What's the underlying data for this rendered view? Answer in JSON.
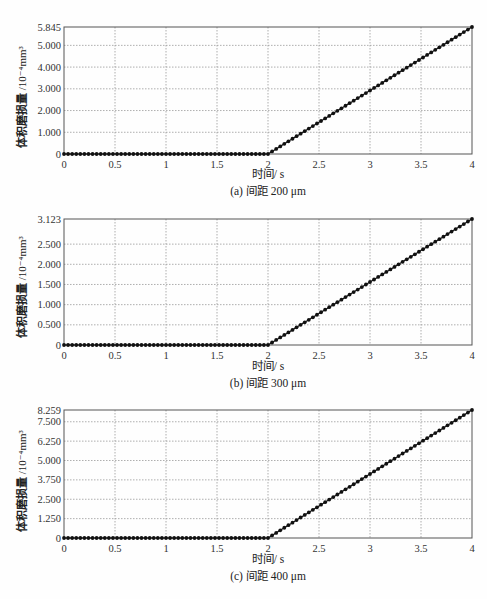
{
  "chart_data": [
    {
      "type": "line",
      "title": "(a) 间距 200 μm",
      "xlabel": "时间/ s",
      "ylabel": "体积磨损量 /10⁻⁴mm³",
      "xlim": [
        0,
        4
      ],
      "ylim": [
        0,
        5.845
      ],
      "xticks": [
        "0",
        "0.5",
        "1",
        "1.5",
        "2",
        "2.5",
        "3",
        "3.5",
        "4"
      ],
      "yticks": [
        "0",
        "1.000",
        "2.000",
        "3.000",
        "4.000",
        "5.000",
        "5.845"
      ],
      "ytick_values": [
        0,
        1,
        2,
        3,
        4,
        5,
        5.845
      ],
      "grid": true,
      "marker": "dot",
      "series": [
        {
          "name": "体积磨损量",
          "x_start": 0,
          "x_end": 4,
          "step": 0.04,
          "onset": 2,
          "y_end": 5.845,
          "description": "0 for t≤2 s, then linear increase to 5.845 at t=4 s"
        }
      ]
    },
    {
      "type": "line",
      "title": "(b) 间距 300 μm",
      "xlabel": "时间/ s",
      "ylabel": "体积磨损量 /10⁻⁴mm³",
      "xlim": [
        0,
        4
      ],
      "ylim": [
        0,
        3.123
      ],
      "xticks": [
        "0",
        "0.5",
        "1",
        "1.5",
        "2",
        "2.5",
        "3",
        "3.5",
        "4"
      ],
      "yticks": [
        "0",
        "0.500",
        "1.000",
        "1.500",
        "2.000",
        "2.500",
        "3.123"
      ],
      "ytick_values": [
        0,
        0.5,
        1,
        1.5,
        2,
        2.5,
        3.123
      ],
      "grid": true,
      "marker": "dot",
      "series": [
        {
          "name": "体积磨损量",
          "x_start": 0,
          "x_end": 4,
          "step": 0.04,
          "onset": 2,
          "y_end": 3.123,
          "description": "0 for t≤2 s, then linear increase to 3.123 at t=4 s"
        }
      ]
    },
    {
      "type": "line",
      "title": "(c) 间距 400 μm",
      "xlabel": "时间/ s",
      "ylabel": "体积磨损量 /10⁻⁴mm³",
      "xlim": [
        0,
        4
      ],
      "ylim": [
        0,
        8.259
      ],
      "xticks": [
        "0",
        "0.5",
        "1",
        "1.5",
        "2",
        "2.5",
        "3",
        "3.5",
        "4"
      ],
      "yticks": [
        "0",
        "1.250",
        "2.500",
        "3.750",
        "5.000",
        "6.250",
        "7.500",
        "8.259"
      ],
      "ytick_values": [
        0,
        1.25,
        2.5,
        3.75,
        5,
        6.25,
        7.5,
        8.259
      ],
      "grid": true,
      "marker": "dot",
      "series": [
        {
          "name": "体积磨损量",
          "x_start": 0,
          "x_end": 4,
          "step": 0.04,
          "onset": 2,
          "y_end": 8.259,
          "description": "0 for t≤2 s, then linear increase to 8.259 at t=4 s"
        }
      ]
    }
  ],
  "panels": [
    {
      "caption": "(a) 间距 200 μm",
      "xlabel": "时间/ s",
      "ylabel_main": "体积磨损量 ",
      "ylabel_unit": "/10⁻⁴mm³"
    },
    {
      "caption": "(b) 间距 300 μm",
      "xlabel": "时间/ s",
      "ylabel_main": "体积磨损量 ",
      "ylabel_unit": "/10⁻⁴mm³"
    },
    {
      "caption": "(c) 间距 400 μm",
      "xlabel": "时间/ s",
      "ylabel_main": "体积磨损量 ",
      "ylabel_unit": "/10⁻⁴mm³"
    }
  ],
  "style": {
    "line_color": "#111111",
    "grid_color": "#9a9a9a",
    "axis_color": "#555555"
  }
}
